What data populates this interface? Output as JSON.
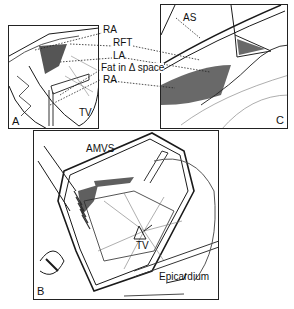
{
  "figure": {
    "panels": [
      {
        "id": "A",
        "label": "A"
      },
      {
        "id": "B",
        "label": "B"
      },
      {
        "id": "C",
        "label": "C"
      }
    ],
    "labels": {
      "ra_top": "RA",
      "rft": "RFT",
      "la": "LA",
      "fat": "Fat in Δ space",
      "ra_bottom": "RA",
      "tv_a": "TV",
      "as": "AS",
      "amvs": "AMVS",
      "tv_b": "TV",
      "epicardium": "Epicardium"
    },
    "colors": {
      "ink": "#1a1a1a",
      "paper": "#ffffff",
      "shade": "#3a3a3a"
    }
  }
}
